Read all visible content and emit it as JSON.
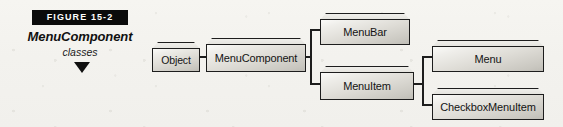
{
  "figure": {
    "bar_label": "FIGURE  15-2",
    "caption_title": "MenuComponent",
    "caption_subtitle": "classes",
    "arrow_icon": "down-triangle-icon"
  },
  "diagram": {
    "type": "class-hierarchy",
    "nodes": [
      {
        "id": "object",
        "label": "Object"
      },
      {
        "id": "menucomponent",
        "label": "MenuComponent"
      },
      {
        "id": "menubar",
        "label": "MenuBar"
      },
      {
        "id": "menuitem",
        "label": "MenuItem"
      },
      {
        "id": "menu",
        "label": "Menu"
      },
      {
        "id": "checkboxmenuitem",
        "label": "CheckboxMenuItem"
      }
    ],
    "edges": [
      {
        "from": "object",
        "to": "menucomponent"
      },
      {
        "from": "menucomponent",
        "to": "menubar"
      },
      {
        "from": "menucomponent",
        "to": "menuitem"
      },
      {
        "from": "menuitem",
        "to": "menu"
      },
      {
        "from": "menuitem",
        "to": "checkboxmenuitem"
      }
    ]
  },
  "colors": {
    "background": "#f4f3ef",
    "bar_fill": "#0b0b0b",
    "bar_text": "#ffffff",
    "line": "#1d1d1d",
    "box_fill_light": "#efeeea",
    "box_fill_dark": "#c9c7c0",
    "text": "#141414"
  }
}
